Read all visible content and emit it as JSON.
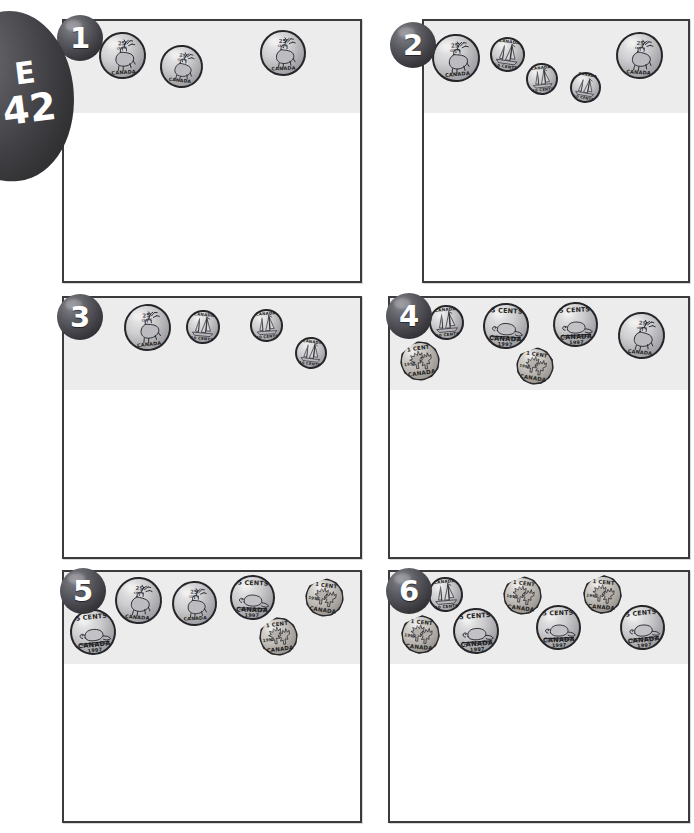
{
  "page": {
    "code_letter": "E",
    "code_number": "42",
    "sheet_type": "coin-counting-worksheet",
    "currency": "Canadian",
    "columns": 2,
    "rows": 3
  },
  "coin_types": {
    "quarter": {
      "name": "quarter",
      "value_cents": 25,
      "obverse_text_top": "25",
      "obverse_text_sub": "CENTS",
      "rim_text": "CANADA",
      "motif": "caribou",
      "shape": "round",
      "metal_color": "#c9c9cc",
      "diameter_px": 46
    },
    "dime": {
      "name": "dime",
      "value_cents": 10,
      "rim_text_top": "CANADA",
      "rim_text_bottom": "10 CENTS",
      "motif": "bluenose-schooner",
      "shape": "round",
      "metal_color": "#c9c9cc",
      "diameter_px": 33
    },
    "nickel": {
      "name": "nickel",
      "value_cents": 5,
      "text_top": "5 CENTS",
      "text_bottom": "CANADA",
      "text_year": "1997",
      "motif": "beaver",
      "shape": "round",
      "metal_color": "#c9c9cc",
      "diameter_px": 44
    },
    "penny": {
      "name": "penny",
      "value_cents": 1,
      "text_top": "1 CENT",
      "text_bottom": "CANADA",
      "text_year": "1997",
      "motif": "maple-leaves",
      "shape": "12-sided",
      "metal_color": "#bdb8b2",
      "diameter_px": 38
    }
  },
  "problems": [
    {
      "number": "1",
      "box": {
        "x": 62,
        "y": 19,
        "w": 300,
        "h": 264
      },
      "number_pos": {
        "x": 57,
        "y": 15
      },
      "coins": [
        {
          "type": "quarter",
          "x": 99,
          "y": 32,
          "size": 47,
          "rot": -4
        },
        {
          "type": "quarter",
          "x": 160,
          "y": 45,
          "size": 43,
          "rot": 6
        },
        {
          "type": "quarter",
          "x": 260,
          "y": 30,
          "size": 46,
          "rot": -2
        }
      ]
    },
    {
      "number": "2",
      "box": {
        "x": 422,
        "y": 19,
        "w": 268,
        "h": 264
      },
      "number_pos": {
        "x": 390,
        "y": 22
      },
      "coins": [
        {
          "type": "quarter",
          "x": 432,
          "y": 34,
          "size": 48,
          "rot": -5
        },
        {
          "type": "dime",
          "x": 490,
          "y": 37,
          "size": 35,
          "rot": 8
        },
        {
          "type": "dime",
          "x": 526,
          "y": 63,
          "size": 32,
          "rot": -6
        },
        {
          "type": "dime",
          "x": 570,
          "y": 72,
          "size": 31,
          "rot": 10
        },
        {
          "type": "quarter",
          "x": 616,
          "y": 32,
          "size": 47,
          "rot": 3
        }
      ]
    },
    {
      "number": "3",
      "box": {
        "x": 62,
        "y": 296,
        "w": 300,
        "h": 263
      },
      "number_pos": {
        "x": 57,
        "y": 294
      },
      "coins": [
        {
          "type": "quarter",
          "x": 124,
          "y": 304,
          "size": 47,
          "rot": -6
        },
        {
          "type": "dime",
          "x": 186,
          "y": 310,
          "size": 34,
          "rot": 5
        },
        {
          "type": "dime",
          "x": 250,
          "y": 309,
          "size": 33,
          "rot": -4
        },
        {
          "type": "dime",
          "x": 295,
          "y": 337,
          "size": 32,
          "rot": 7
        }
      ]
    },
    {
      "number": "4",
      "box": {
        "x": 388,
        "y": 296,
        "w": 302,
        "h": 263
      },
      "number_pos": {
        "x": 386,
        "y": 293
      },
      "coins": [
        {
          "type": "dime",
          "x": 429,
          "y": 305,
          "size": 35,
          "rot": -5
        },
        {
          "type": "nickel",
          "x": 483,
          "y": 303,
          "size": 46,
          "rot": 3
        },
        {
          "type": "penny",
          "x": 400,
          "y": 341,
          "size": 40,
          "rot": -8
        },
        {
          "type": "nickel",
          "x": 553,
          "y": 302,
          "size": 45,
          "rot": -3
        },
        {
          "type": "penny",
          "x": 516,
          "y": 347,
          "size": 38,
          "rot": 9
        },
        {
          "type": "quarter",
          "x": 618,
          "y": 312,
          "size": 47,
          "rot": 5
        }
      ]
    },
    {
      "number": "5",
      "box": {
        "x": 62,
        "y": 570,
        "w": 300,
        "h": 253
      },
      "number_pos": {
        "x": 60,
        "y": 568
      },
      "coins": [
        {
          "type": "nickel",
          "x": 70,
          "y": 609,
          "size": 46,
          "rot": -6
        },
        {
          "type": "quarter",
          "x": 115,
          "y": 577,
          "size": 47,
          "rot": 4
        },
        {
          "type": "quarter",
          "x": 172,
          "y": 581,
          "size": 45,
          "rot": -3
        },
        {
          "type": "nickel",
          "x": 230,
          "y": 575,
          "size": 45,
          "rot": 2
        },
        {
          "type": "penny",
          "x": 259,
          "y": 617,
          "size": 39,
          "rot": -7
        },
        {
          "type": "penny",
          "x": 305,
          "y": 578,
          "size": 39,
          "rot": 8
        }
      ]
    },
    {
      "number": "6",
      "box": {
        "x": 388,
        "y": 570,
        "w": 302,
        "h": 253
      },
      "number_pos": {
        "x": 386,
        "y": 568
      },
      "coins": [
        {
          "type": "dime",
          "x": 428,
          "y": 577,
          "size": 35,
          "rot": -5
        },
        {
          "type": "penny",
          "x": 401,
          "y": 615,
          "size": 39,
          "rot": 6
        },
        {
          "type": "nickel",
          "x": 453,
          "y": 608,
          "size": 46,
          "rot": -4
        },
        {
          "type": "penny",
          "x": 503,
          "y": 576,
          "size": 39,
          "rot": 7
        },
        {
          "type": "nickel",
          "x": 536,
          "y": 605,
          "size": 45,
          "rot": -2
        },
        {
          "type": "penny",
          "x": 583,
          "y": 575,
          "size": 39,
          "rot": 5
        },
        {
          "type": "nickel",
          "x": 620,
          "y": 605,
          "size": 45,
          "rot": -6
        }
      ]
    }
  ]
}
